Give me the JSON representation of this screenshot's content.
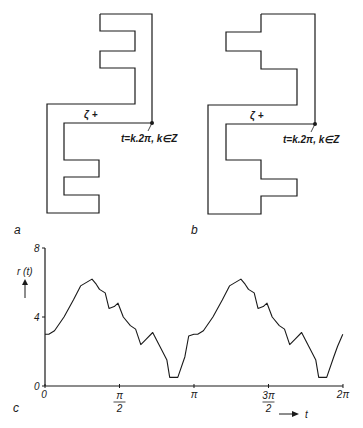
{
  "figure": {
    "panel_a": {
      "label": "a",
      "zeta_label": "ζ +",
      "point_annotation": "t=k.2π, k∈Z",
      "outline": [
        [
          100,
          14
        ],
        [
          152,
          14
        ],
        [
          152,
          123
        ],
        [
          64,
          123
        ],
        [
          64,
          160
        ],
        [
          99,
          160
        ],
        [
          99,
          177
        ],
        [
          64,
          177
        ],
        [
          64,
          195
        ],
        [
          99,
          195
        ],
        [
          99,
          213
        ],
        [
          47,
          213
        ],
        [
          47,
          104
        ],
        [
          135,
          104
        ],
        [
          135,
          68
        ],
        [
          100,
          68
        ],
        [
          100,
          51
        ],
        [
          135,
          51
        ],
        [
          135,
          31
        ],
        [
          100,
          31
        ],
        [
          100,
          14
        ]
      ]
    },
    "panel_b": {
      "label": "b",
      "zeta_label": "ζ +",
      "point_annotation": "t=k.2π, k∈Z",
      "outline": [
        [
          261,
          14
        ],
        [
          315,
          14
        ],
        [
          315,
          124
        ],
        [
          226,
          124
        ],
        [
          226,
          160
        ],
        [
          261,
          160
        ],
        [
          261,
          179
        ],
        [
          297,
          179
        ],
        [
          297,
          196
        ],
        [
          261,
          196
        ],
        [
          261,
          214
        ],
        [
          208,
          214
        ],
        [
          208,
          105
        ],
        [
          297,
          105
        ],
        [
          297,
          69
        ],
        [
          261,
          69
        ],
        [
          261,
          51
        ],
        [
          226,
          51
        ],
        [
          226,
          32
        ],
        [
          261,
          32
        ],
        [
          261,
          14
        ]
      ]
    },
    "panel_c": {
      "label": "c",
      "y_axis_label": "r (t)",
      "x_axis_label": "t",
      "y_ticks": [
        "0",
        "4",
        "8"
      ],
      "x_ticks": [
        "0",
        "π/2",
        "π",
        "3π/2",
        "2π"
      ]
    }
  },
  "chart_data": {
    "type": "line",
    "title": "",
    "xlabel": "t",
    "ylabel": "r(t)",
    "xlim": [
      0,
      6.2832
    ],
    "ylim": [
      0,
      8
    ],
    "x_tick_labels": [
      "0",
      "π/2",
      "π",
      "3π/2",
      "2π"
    ],
    "y_tick_labels": [
      "0",
      "4",
      "8"
    ],
    "grid": false,
    "series": [
      {
        "name": "r(t)",
        "x": [
          0,
          0.08,
          0.2,
          0.4,
          0.6,
          0.75,
          0.99,
          1.08,
          1.15,
          1.27,
          1.35,
          1.46,
          1.54,
          1.65,
          1.8,
          1.91,
          2.02,
          2.13,
          2.27,
          2.42,
          2.57,
          2.63,
          2.8,
          2.95,
          3.03,
          3.14,
          3.22,
          3.34,
          3.54,
          3.74,
          3.89,
          4.13,
          4.22,
          4.29,
          4.41,
          4.49,
          4.6,
          4.68,
          4.79,
          4.94,
          5.05,
          5.16,
          5.27,
          5.41,
          5.56,
          5.71,
          5.77,
          5.94,
          6.09,
          6.17,
          6.28
        ],
        "y": [
          3.0,
          3.0,
          3.2,
          4.0,
          5.0,
          5.8,
          6.2,
          5.9,
          5.6,
          5.4,
          4.5,
          4.6,
          4.8,
          4.0,
          3.5,
          3.3,
          2.4,
          2.7,
          3.1,
          2.3,
          1.5,
          0.5,
          0.5,
          1.7,
          2.9,
          3.0,
          3.0,
          3.2,
          4.0,
          5.0,
          5.8,
          6.2,
          5.9,
          5.6,
          5.4,
          4.5,
          4.6,
          4.8,
          4.0,
          3.5,
          3.3,
          2.4,
          2.7,
          3.1,
          2.3,
          1.5,
          0.5,
          0.5,
          1.7,
          2.3,
          3.0
        ]
      }
    ],
    "annotations": [
      "period π (curve repeats on [π, 2π])"
    ]
  }
}
